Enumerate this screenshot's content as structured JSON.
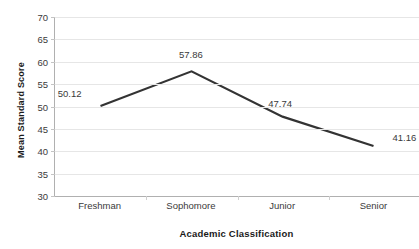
{
  "chart_data": {
    "type": "line",
    "title": "",
    "xlabel": "Academic Classification",
    "ylabel": "Mean Standard Score",
    "categories": [
      "Freshman",
      "Sophomore",
      "Junior",
      "Senior"
    ],
    "values": [
      50.12,
      57.86,
      47.74,
      41.16
    ],
    "point_labels": [
      "50.12",
      "57.86",
      "47.74",
      "41.16"
    ],
    "ylim": [
      30,
      70
    ],
    "yticks": [
      70,
      65,
      60,
      55,
      50,
      45,
      40,
      35,
      30
    ],
    "ytick_labels": [
      "70",
      "65",
      "60",
      "55",
      "50",
      "45",
      "40",
      "35",
      "30"
    ],
    "grid": "horizontal",
    "legend": "none",
    "line_color": "#333333",
    "grid_color": "#e6e6e6",
    "axis_color": "#b0b0b0",
    "background": "#ffffff"
  }
}
